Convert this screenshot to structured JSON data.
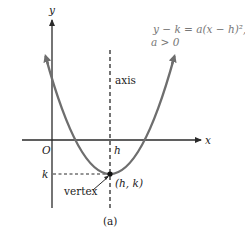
{
  "diagram": {
    "equation_line1": "y − k = a(x − h)²,",
    "equation_line2": "a > 0",
    "axis_labels": {
      "y": "y",
      "x": "x",
      "origin": "O"
    },
    "point_labels": {
      "h": "h",
      "k": "k",
      "vertex_coord": "(h, k)",
      "vertex": "vertex",
      "axis": "axis"
    },
    "caption": "(a)",
    "colors": {
      "curve": "#6e6e6e",
      "axes": "#2a2a2a",
      "equation_text": "#777777"
    }
  }
}
